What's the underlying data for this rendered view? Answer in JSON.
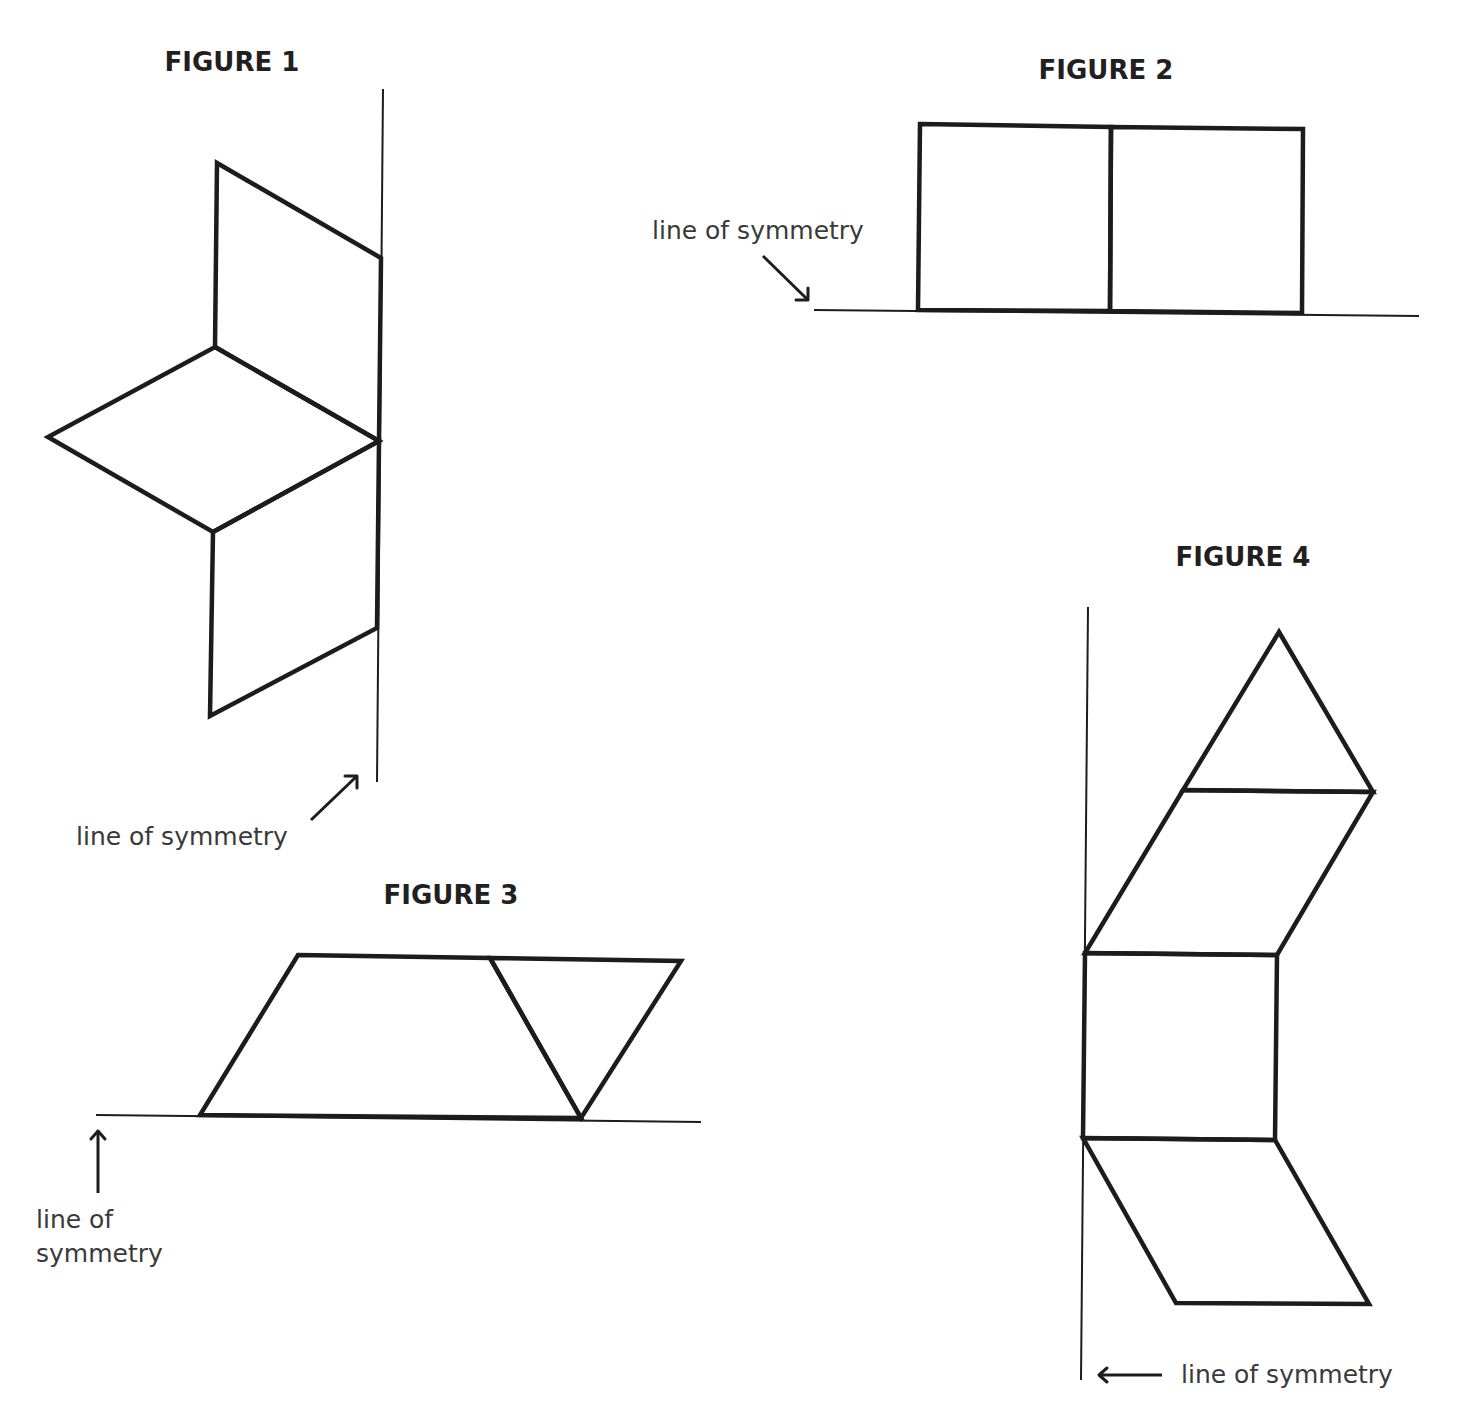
{
  "figures": [
    {
      "title": "FIGURE 1",
      "label": "line of symmetry",
      "symmetry_axis": "vertical",
      "shapes": [
        "parallelogram",
        "rhombus",
        "parallelogram"
      ]
    },
    {
      "title": "FIGURE 2",
      "label": "line of symmetry",
      "symmetry_axis": "horizontal",
      "shapes": [
        "square",
        "square"
      ]
    },
    {
      "title": "FIGURE 3",
      "label_line1": "line of",
      "label_line2": "symmetry",
      "symmetry_axis": "horizontal",
      "shapes": [
        "trapezoid",
        "triangle"
      ]
    },
    {
      "title": "FIGURE 4",
      "label": "line of symmetry",
      "symmetry_axis": "vertical",
      "shapes": [
        "triangle",
        "rhombus",
        "square",
        "rhombus"
      ]
    }
  ],
  "colors": {
    "stroke": "#1c1c1c",
    "text": "#231f20",
    "background": "#ffffff"
  }
}
